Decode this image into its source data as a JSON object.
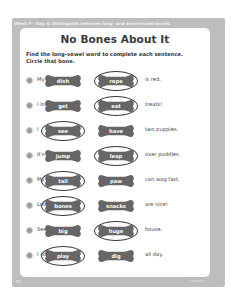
{
  "header": {
    "strip_text": "Week 7 · Day 4: Distinguish between long- and short-vowel words"
  },
  "worksheet": {
    "title": "No Bones About It",
    "instructions_line1": "Find the long-vowel word to complete each sentence.",
    "instructions_line2": "Circle that bone.",
    "rows": [
      {
        "start": "My",
        "option1": "dish",
        "option2": "rope",
        "end": "is red.",
        "circled": 2
      },
      {
        "start": "I love to",
        "option1": "get",
        "option2": "eat",
        "end": "treats!",
        "circled": 2
      },
      {
        "start": "I",
        "option1": "see",
        "option2": "have",
        "end": "two puppies.",
        "circled": 1
      },
      {
        "start": "It's fun to",
        "option1": "jump",
        "option2": "leap",
        "end": "over puddles.",
        "circled": 2
      },
      {
        "start": "My",
        "option1": "tail",
        "option2": "paw",
        "end": "can wag fast.",
        "circled": 1
      },
      {
        "start": "Lots of",
        "option1": "bones",
        "option2": "snacks",
        "end": "are nice!",
        "circled": 1
      },
      {
        "start": "See my",
        "option1": "big",
        "option2": "huge",
        "end": "house.",
        "circled": 2
      },
      {
        "start": "I could",
        "option1": "play",
        "option2": "dig",
        "end": "all day.",
        "circled": 1
      }
    ]
  },
  "footer": {
    "page_number": "90",
    "credit": "Scholastic"
  },
  "colors": {
    "frame": "#bdbdbd",
    "bone": "#666666",
    "circle_stroke": "#3a3a3a",
    "title": "#3a3a3a"
  }
}
